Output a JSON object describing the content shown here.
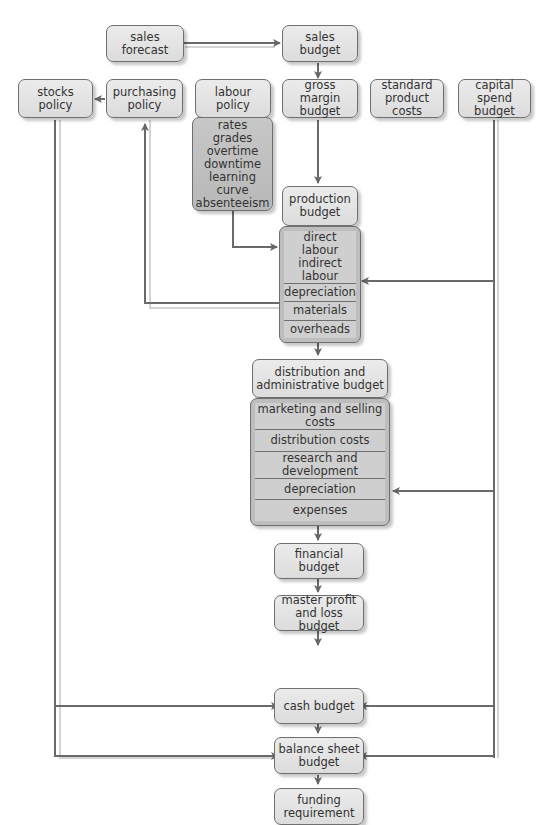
{
  "diagram": {
    "type": "budget flowchart",
    "nodes": {
      "sales_forecast": "sales\nforecast",
      "sales_budget": "sales\nbudget",
      "stocks_policy": "stocks\npolicy",
      "purchasing_policy": "purchasing\npolicy",
      "labour_policy": "labour\npolicy",
      "gross_margin_budget": "gross margin\nbudget",
      "standard_product_costs": "standard\nproduct costs",
      "capital_spend_budget": "capital\nspend budget",
      "labour_factors": "rates\ngrades\novertime\ndowntime\nlearning curve\nabsenteeism",
      "production_budget": "production\nbudget",
      "production_items": [
        "direct labour\nindirect labour",
        "depreciation",
        "materials",
        "overheads"
      ],
      "distribution_admin_budget": "distribution and\nadministrative budget",
      "distribution_items": [
        "marketing and selling costs",
        "distribution costs",
        "research and development",
        "depreciation",
        "expenses"
      ],
      "financial_budget": "financial\nbudget",
      "master_pl_budget": "master profit\nand loss budget",
      "cash_budget": "cash budget",
      "balance_sheet_budget": "balance sheet\nbudget",
      "funding_requirement": "funding\nrequirement"
    },
    "edges": [
      [
        "sales forecast",
        "sales budget"
      ],
      [
        "sales budget",
        "gross margin budget"
      ],
      [
        "standard product costs",
        "gross margin budget"
      ],
      [
        "purchasing policy",
        "stocks policy"
      ],
      [
        "gross margin budget",
        "production budget"
      ],
      [
        "labour factors",
        "direct/indirect labour"
      ],
      [
        "materials",
        "purchasing policy"
      ],
      [
        "capital spend budget",
        "production depreciation"
      ],
      [
        "capital spend budget",
        "distribution depreciation"
      ],
      [
        "overheads",
        "distribution and administrative budget"
      ],
      [
        "distribution and administrative budget",
        "financial budget"
      ],
      [
        "financial budget",
        "master profit and loss budget"
      ],
      [
        "master profit and loss budget",
        "cash budget"
      ],
      [
        "stocks policy",
        "cash budget"
      ],
      [
        "capital spend budget",
        "cash budget"
      ],
      [
        "cash budget",
        "balance sheet budget"
      ],
      [
        "stocks policy",
        "balance sheet budget"
      ],
      [
        "capital spend budget",
        "balance sheet budget"
      ],
      [
        "balance sheet budget",
        "funding requirement"
      ]
    ]
  }
}
